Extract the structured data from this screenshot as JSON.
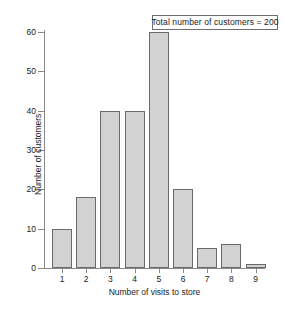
{
  "chart_data": {
    "type": "bar",
    "title": "",
    "xlabel": "Number of visits to store",
    "ylabel": "Number of customers",
    "categories": [
      "1",
      "2",
      "3",
      "4",
      "5",
      "6",
      "7",
      "8",
      "9"
    ],
    "values": [
      10,
      18,
      40,
      40,
      60,
      20,
      5,
      6,
      1
    ],
    "ylim": [
      0,
      60
    ],
    "y_ticks": [
      0,
      10,
      20,
      30,
      40,
      50,
      60
    ],
    "x_ticks": [
      "1",
      "2",
      "3",
      "4",
      "5",
      "6",
      "7",
      "8",
      "9"
    ],
    "grid": false,
    "legend": false,
    "annotations": [
      {
        "text": "Total number of customers = 200",
        "position": "top-right",
        "boxed": true
      }
    ],
    "colors": {
      "bar_fill": "#d2d2d2",
      "bar_edge": "#6a6a6a",
      "axis": "#8a8a8a",
      "text": "#1a1a1a",
      "background": "#ffffff"
    }
  }
}
